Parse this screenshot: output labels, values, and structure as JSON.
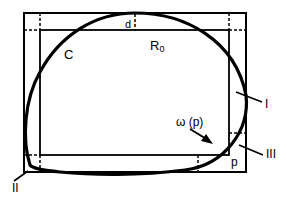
{
  "diagram": {
    "type": "geometric-figure",
    "colors": {
      "stroke": "#000000",
      "background": "#ffffff"
    },
    "labels": {
      "curve": "C",
      "offset": "d",
      "inner_rect_base": "R",
      "inner_rect_sub": "0",
      "region_1": "I",
      "region_2": "II",
      "region_3": "III",
      "omega": "ω (p)",
      "point": "p"
    },
    "shapes": {
      "outer_rect": {
        "x": 24,
        "y": 13,
        "w": 222,
        "h": 159
      },
      "inner_rect": {
        "x": 40,
        "y": 30,
        "w": 189,
        "h": 125
      }
    }
  }
}
